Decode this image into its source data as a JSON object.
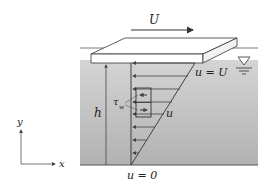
{
  "diagram": {
    "labels": {
      "plate_velocity": "U",
      "surface_condition": "u = U",
      "bottom_condition": "u = 0",
      "depth": "h",
      "velocity": "u",
      "shear_stress": "τ",
      "shear_stress_sub": "w",
      "x_axis": "x",
      "y_axis": "y"
    },
    "colors": {
      "fluid_top": "#cfcfcf",
      "fluid_bottom": "#b4b4b4",
      "plate": "#ffffff",
      "stroke": "#333333"
    },
    "velocity_arrows": 8
  }
}
